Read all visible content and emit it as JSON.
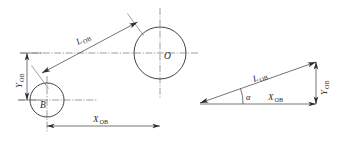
{
  "figure": {
    "type": "engineering-dimension-diagram",
    "background_color": "#ffffff",
    "line_color": "#3a3a3a",
    "text_color": "#1f1f1f"
  },
  "left_view": {
    "name": "plan-view-two-circles",
    "circle_o": {
      "center_label": "O",
      "cx": 160,
      "cy": 53,
      "r": 26
    },
    "circle_b": {
      "center_label": "B",
      "cx": 47,
      "cy": 100,
      "r": 17
    },
    "dimensions": {
      "diagonal": {
        "symbol": "L",
        "subscript": "OB"
      },
      "vertical": {
        "symbol": "Y",
        "subscript": "OB"
      },
      "horizontal": {
        "symbol": "X",
        "subscript": "OB"
      }
    }
  },
  "right_view": {
    "name": "vector-triangle",
    "dimensions": {
      "hypotenuse": {
        "symbol": "L",
        "subscript": "OB"
      },
      "base": {
        "symbol": "X",
        "subscript": "OB"
      },
      "vertical": {
        "symbol": "Y",
        "subscript": "OB"
      }
    },
    "angle": {
      "symbol": "α"
    },
    "vertices": {
      "left": {
        "x": 196,
        "y": 104
      },
      "right_bottom": {
        "x": 316,
        "y": 104
      },
      "right_top": {
        "x": 316,
        "y": 61
      }
    }
  }
}
